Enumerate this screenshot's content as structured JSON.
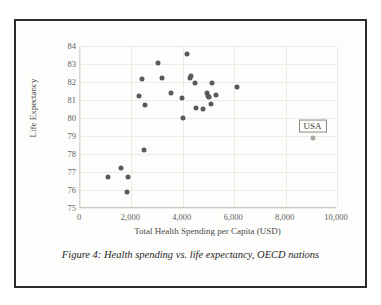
{
  "figure": {
    "caption": "Figure 4: Health spending vs. life expectancy, OECD nations",
    "frame_color": "#2b2b2b",
    "background": "#fdfdfb"
  },
  "chart_data": {
    "type": "scatter",
    "title": "",
    "xlabel": "Total Health Spending per Capita (USD)",
    "ylabel": "Life Expectancy",
    "xlim": [
      0,
      10000
    ],
    "ylim": [
      75,
      84
    ],
    "xticks": [
      0,
      2000,
      4000,
      6000,
      8000,
      10000
    ],
    "xtick_labels": [
      "0",
      "2,000",
      "4,000",
      "6,000",
      "8,000",
      "10,000"
    ],
    "yticks": [
      75,
      76,
      77,
      78,
      79,
      80,
      81,
      82,
      83,
      84
    ],
    "ytick_labels": [
      "75",
      "76",
      "77",
      "78",
      "79",
      "80",
      "81",
      "82",
      "83",
      "84"
    ],
    "grid": "both",
    "legend": "none",
    "marker_color": "#59595a",
    "highlight_color": "#a9a9a6",
    "annotations": [
      {
        "label": "USA",
        "x": 9050,
        "y": 78.9
      }
    ],
    "points": [
      {
        "x": 1100,
        "y": 76.7
      },
      {
        "x": 1600,
        "y": 77.2
      },
      {
        "x": 1820,
        "y": 75.9
      },
      {
        "x": 1870,
        "y": 76.7
      },
      {
        "x": 2300,
        "y": 81.25
      },
      {
        "x": 2420,
        "y": 82.15
      },
      {
        "x": 2480,
        "y": 78.25
      },
      {
        "x": 2530,
        "y": 80.7
      },
      {
        "x": 3050,
        "y": 83.05
      },
      {
        "x": 3200,
        "y": 82.25
      },
      {
        "x": 3550,
        "y": 81.4
      },
      {
        "x": 3950,
        "y": 81.1
      },
      {
        "x": 4020,
        "y": 80.0
      },
      {
        "x": 4180,
        "y": 83.55
      },
      {
        "x": 4270,
        "y": 82.25
      },
      {
        "x": 4330,
        "y": 82.35
      },
      {
        "x": 4480,
        "y": 81.95
      },
      {
        "x": 4520,
        "y": 80.55
      },
      {
        "x": 4780,
        "y": 80.5
      },
      {
        "x": 4950,
        "y": 81.4
      },
      {
        "x": 4980,
        "y": 81.25
      },
      {
        "x": 5020,
        "y": 81.15
      },
      {
        "x": 5080,
        "y": 80.8
      },
      {
        "x": 5120,
        "y": 81.95
      },
      {
        "x": 5280,
        "y": 81.3
      },
      {
        "x": 6100,
        "y": 81.75
      },
      {
        "x": 9050,
        "y": 78.9,
        "highlight": true
      }
    ]
  }
}
